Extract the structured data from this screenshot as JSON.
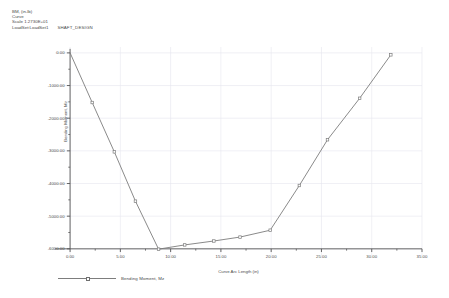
{
  "header": {
    "quantity_line": "BM, (in-lb)",
    "curve_line": "Curve",
    "scale_line": "Scale 1.2730E+01",
    "loadset_line": "LoadSet:LoadSet1",
    "design_name": "SHAFT_DESIGN"
  },
  "legend": {
    "series_label": "Bending Moment, Mz"
  },
  "colors": {
    "curve": "#7d7d7d",
    "axis": "#555555",
    "grid": "#e6e6ef",
    "text": "#4a4a4a",
    "background": "#ffffff"
  },
  "chart_data": {
    "type": "line",
    "title": "",
    "xlabel": "Curve Arc Length (in)",
    "ylabel": "Bending Moment, Mz",
    "xlim": [
      -1.5,
      35.0
    ],
    "ylim": [
      -6250,
      180
    ],
    "xticks": [
      0.0,
      5.0,
      10.0,
      15.0,
      20.0,
      25.0,
      30.0,
      35.0
    ],
    "xtick_labels": [
      "0.00",
      "5.00",
      "10.00",
      "15.00",
      "20.00",
      "25.00",
      "30.00",
      "35.00"
    ],
    "yticks": [
      0,
      -1000,
      -2000,
      -3000,
      -4000,
      -5000,
      -6000
    ],
    "ytick_labels": [
      "0.00",
      "-1000.00",
      "-2000.00",
      "-3000.00",
      "-4000.00",
      "-5000.00",
      "-6000.00"
    ],
    "grid": true,
    "legend_position": "below-left",
    "series": [
      {
        "name": "Bending Moment, Mz",
        "marker": "square",
        "x": [
          0.0,
          2.2,
          4.4,
          6.5,
          8.8,
          11.4,
          14.3,
          16.9,
          19.9,
          22.8,
          25.6,
          28.8,
          31.9
        ],
        "y": [
          0,
          -1520,
          -3030,
          -4540,
          -6010,
          -5880,
          -5760,
          -5640,
          -5430,
          -4060,
          -2660,
          -1390,
          -60
        ]
      }
    ]
  }
}
